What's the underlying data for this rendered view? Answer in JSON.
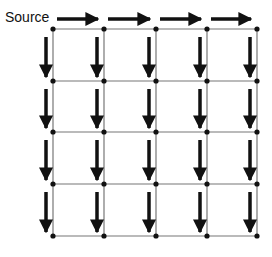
{
  "diagram": {
    "title": "",
    "source_label": "Source",
    "grid": {
      "cols": 4,
      "rows": 4,
      "x_nodes": [
        53,
        104,
        156,
        207,
        257
      ],
      "y_nodes": [
        29,
        81,
        132,
        184,
        236
      ]
    },
    "colors": {
      "line": "#777777",
      "node": "#111111",
      "arrow": "#111111"
    },
    "arrows": {
      "horizontal": "right-arrows on top edge, one per column (4)",
      "vertical": "down-arrows left of each vertical line in every row (4 rows x 5 lines = 20)"
    }
  }
}
